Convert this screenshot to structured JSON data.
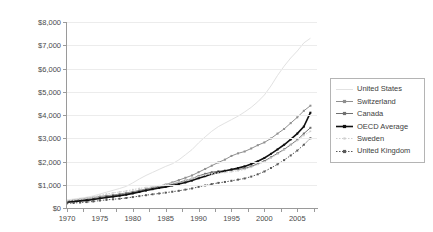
{
  "chart_data": {
    "type": "line",
    "title": "",
    "xlabel": "",
    "ylabel": "Per Capita Spending - PPP Adjusted",
    "xlim": [
      1970,
      2008
    ],
    "ylim": [
      0,
      8000
    ],
    "grid": true,
    "legend_position": "right",
    "x": [
      1970,
      1971,
      1972,
      1973,
      1974,
      1975,
      1976,
      1977,
      1978,
      1979,
      1980,
      1981,
      1982,
      1983,
      1984,
      1985,
      1986,
      1987,
      1988,
      1989,
      1990,
      1991,
      1992,
      1993,
      1994,
      1995,
      1996,
      1997,
      1998,
      1999,
      2000,
      2001,
      2002,
      2003,
      2004,
      2005,
      2006,
      2007
    ],
    "xticks": [
      1970,
      1975,
      1980,
      1985,
      1990,
      1995,
      2000,
      2005
    ],
    "xtick_labels": [
      "1970",
      "1975",
      "1980",
      "1985",
      "1990",
      "1995",
      "2000",
      "2005"
    ],
    "yticks": [
      0,
      1000,
      2000,
      3000,
      4000,
      5000,
      6000,
      7000,
      8000
    ],
    "ytick_labels": [
      "$0",
      "$1,000",
      "$2,000",
      "$3,000",
      "$4,000",
      "$5,000",
      "$6,000",
      "$7,000",
      "$8,000"
    ],
    "series": [
      {
        "name": "United States",
        "color": "#e2e2e2",
        "marker": "none",
        "values": [
          350,
          385,
          425,
          465,
          520,
          600,
          680,
          760,
          840,
          930,
          1080,
          1250,
          1400,
          1530,
          1660,
          1790,
          1900,
          2070,
          2290,
          2510,
          2800,
          3060,
          3300,
          3500,
          3650,
          3800,
          3950,
          4130,
          4330,
          4570,
          4860,
          5250,
          5700,
          6100,
          6450,
          6750,
          7100,
          7300
        ]
      },
      {
        "name": "Switzerland",
        "color": "#8f8f8f",
        "marker": "square",
        "values": [
          300,
          330,
          370,
          410,
          450,
          500,
          530,
          560,
          600,
          650,
          700,
          760,
          820,
          880,
          940,
          1010,
          1100,
          1200,
          1300,
          1400,
          1540,
          1680,
          1820,
          1960,
          2080,
          2240,
          2350,
          2430,
          2560,
          2700,
          2820,
          2990,
          3200,
          3400,
          3650,
          3900,
          4180,
          4400
        ]
      },
      {
        "name": "Canada",
        "color": "#707070",
        "marker": "square",
        "values": [
          280,
          305,
          335,
          365,
          400,
          450,
          490,
          520,
          560,
          600,
          660,
          720,
          790,
          850,
          900,
          960,
          1030,
          1100,
          1180,
          1260,
          1380,
          1470,
          1540,
          1580,
          1610,
          1640,
          1660,
          1700,
          1790,
          1900,
          2020,
          2180,
          2350,
          2520,
          2720,
          2930,
          3200,
          3450
        ]
      },
      {
        "name": "OECD Average",
        "color": "#111111",
        "marker": "square",
        "values": [
          250,
          275,
          300,
          330,
          365,
          410,
          450,
          490,
          530,
          570,
          630,
          690,
          750,
          810,
          860,
          910,
          970,
          1030,
          1100,
          1180,
          1280,
          1370,
          1460,
          1530,
          1590,
          1660,
          1720,
          1790,
          1890,
          2010,
          2150,
          2330,
          2520,
          2720,
          2950,
          3200,
          3500,
          4100
        ]
      },
      {
        "name": "Sweden",
        "color": "#d0d0d0",
        "marker": "dot",
        "values": [
          310,
          345,
          385,
          425,
          470,
          540,
          600,
          650,
          690,
          730,
          790,
          840,
          880,
          920,
          960,
          1000,
          1060,
          1120,
          1190,
          1260,
          1360,
          1420,
          1470,
          1500,
          1530,
          1560,
          1600,
          1660,
          1750,
          1870,
          1990,
          2150,
          2320,
          2500,
          2700,
          2900,
          3120,
          3300
        ]
      },
      {
        "name": "United Kingdom",
        "color": "#5a5a5a",
        "marker": "dotted-square",
        "values": [
          200,
          215,
          235,
          255,
          280,
          320,
          350,
          375,
          400,
          430,
          470,
          510,
          550,
          590,
          625,
          660,
          700,
          740,
          790,
          840,
          910,
          970,
          1030,
          1080,
          1120,
          1170,
          1220,
          1270,
          1350,
          1450,
          1570,
          1720,
          1880,
          2060,
          2260,
          2470,
          2720,
          3000
        ]
      }
    ]
  },
  "legend": {
    "entries": [
      {
        "label": "United States"
      },
      {
        "label": "Switzerland"
      },
      {
        "label": "Canada"
      },
      {
        "label": "OECD Average"
      },
      {
        "label": "Sweden"
      },
      {
        "label": "United Kingdom"
      }
    ]
  }
}
